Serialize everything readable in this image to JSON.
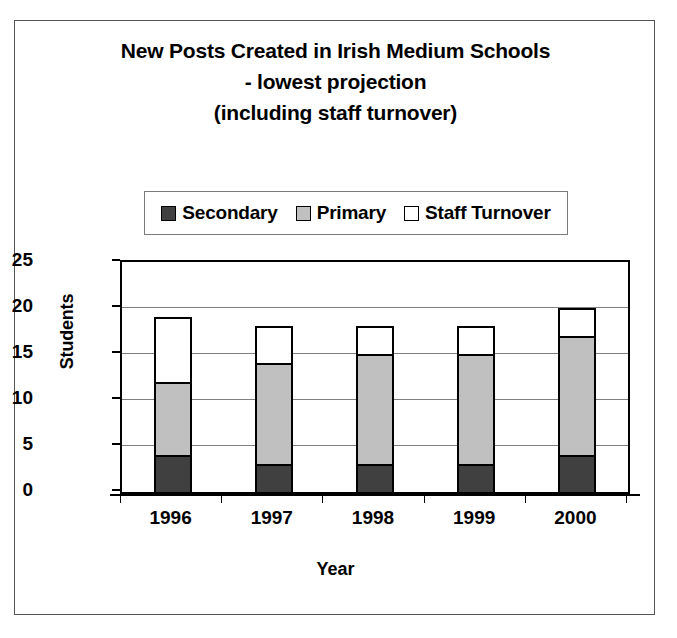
{
  "chart_data": {
    "type": "bar",
    "stacked": true,
    "title": "New Posts Created in Irish Medium Schools - lowest projection (including staff turnover)",
    "title_lines": [
      "New Posts Created in Irish Medium Schools",
      "- lowest projection",
      "(including staff turnover)"
    ],
    "categories": [
      "1996",
      "1997",
      "1998",
      "1999",
      "2000"
    ],
    "series": [
      {
        "name": "Secondary",
        "values": [
          4,
          3,
          3,
          3,
          4
        ],
        "color": "#404040"
      },
      {
        "name": "Primary",
        "values": [
          8,
          11,
          12,
          12,
          13
        ],
        "color": "#c0c0c0"
      },
      {
        "name": "Staff Turnover",
        "values": [
          7,
          4,
          3,
          3,
          3
        ],
        "color": "#ffffff"
      }
    ],
    "totals": [
      19,
      18,
      18,
      18,
      20
    ],
    "xlabel": "Year",
    "ylabel": "Students",
    "ylim": [
      0,
      25
    ],
    "yticks": [
      0,
      5,
      10,
      15,
      20,
      25
    ],
    "ytick_labels": [
      "0",
      "5",
      "10",
      "15",
      "20",
      "25"
    ],
    "grid": true,
    "legend_position": "top-center"
  }
}
